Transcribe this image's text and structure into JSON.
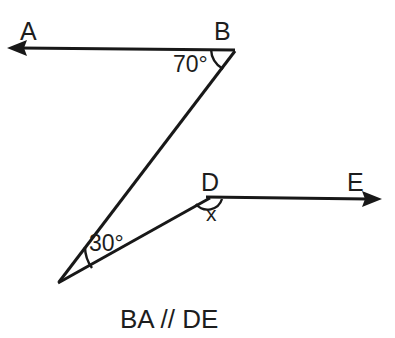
{
  "figure": {
    "type": "geometry-diagram",
    "background_color": "#ffffff",
    "stroke_color": "#181818",
    "text_color": "#1d1d1d",
    "caption": "BA // DE",
    "labels": {
      "point_a": "A",
      "point_b": "B",
      "point_d": "D",
      "point_e": "E",
      "angle_at_b": "70°",
      "angle_at_apex": "30°",
      "angle_at_d": "x"
    },
    "angles": {
      "b_degrees": 70,
      "apex_degrees": 30,
      "d_unknown": "x"
    },
    "points": {
      "a_arrow_tip": [
        7,
        48
      ],
      "b": [
        235,
        50
      ],
      "apex": [
        58,
        283
      ],
      "d": [
        209,
        197
      ],
      "e_arrow_tip": [
        382,
        199
      ]
    },
    "segments": [
      {
        "name": "ray-BA",
        "from": "b",
        "to": "a_arrow_tip",
        "arrow_at": "a_arrow_tip"
      },
      {
        "name": "segment-B-apex",
        "from": "b",
        "to": "apex",
        "arrow_at": "none"
      },
      {
        "name": "segment-apex-D",
        "from": "apex",
        "to": "d",
        "arrow_at": "none"
      },
      {
        "name": "ray-DE",
        "from": "d",
        "to": "e_arrow_tip",
        "arrow_at": "e_arrow_tip"
      }
    ]
  }
}
